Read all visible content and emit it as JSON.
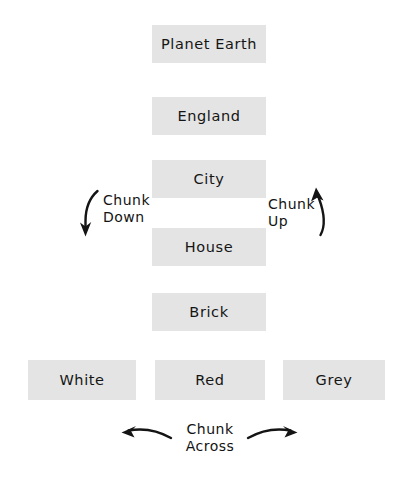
{
  "diagram": {
    "background_color": "#ffffff",
    "node_fill_color": "#e4e4e4",
    "text_color": "#131313",
    "hierarchy": [
      {
        "id": "planet-earth",
        "label": "Planet Earth",
        "level": 1
      },
      {
        "id": "england",
        "label": "England",
        "level": 2
      },
      {
        "id": "city",
        "label": "City",
        "level": 3
      },
      {
        "id": "house",
        "label": "House",
        "level": 4
      },
      {
        "id": "brick",
        "label": "Brick",
        "level": 5
      }
    ],
    "lateral": [
      {
        "id": "white",
        "label": "White"
      },
      {
        "id": "red",
        "label": "Red"
      },
      {
        "id": "grey",
        "label": "Grey"
      }
    ],
    "annotations": {
      "chunk_down": {
        "line1": "Chunk",
        "line2": "Down",
        "arrow": "curved-arrow-down-icon"
      },
      "chunk_up": {
        "line1": "Chunk",
        "line2": "Up",
        "arrow": "curved-arrow-up-icon"
      },
      "chunk_across": {
        "line1": "Chunk",
        "line2": "Across",
        "arrow_left": "curved-arrow-left-icon",
        "arrow_right": "curved-arrow-right-icon"
      }
    }
  }
}
